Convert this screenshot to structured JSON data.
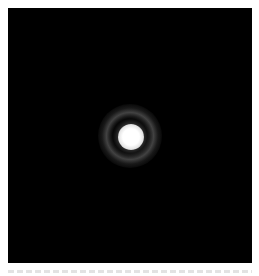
{
  "figure": {
    "background_color": "#000000",
    "spot_color": "#ffffff",
    "ring_color": "#787878"
  },
  "caption": {
    "text": "",
    "truncated": true
  }
}
